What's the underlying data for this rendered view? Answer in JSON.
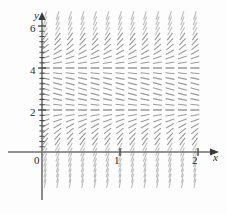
{
  "figure": {
    "background_color": "#fdfdfd",
    "width": 227,
    "height": 214
  },
  "axes": {
    "x_axis_label": "x",
    "y_axis_label": "y",
    "origin_label": "0",
    "axis_color": "#6f6f6f",
    "tick_color": "#4a4a4a",
    "x_ticks": [
      {
        "label": "1",
        "value": 1
      },
      {
        "label": "2",
        "value": 2
      }
    ],
    "y_ticks": [
      {
        "label": "2",
        "value": 2
      },
      {
        "label": "4",
        "value": 4
      },
      {
        "label": "6",
        "value": 6
      }
    ],
    "y_minor_tick_step": 0.25
  },
  "chart_data": {
    "type": "scatter",
    "plot_kind": "slope-field",
    "title": "",
    "xlabel": "x",
    "ylabel": "y",
    "xlim": [
      0,
      2.15
    ],
    "ylim": [
      -1.6,
      6.6
    ],
    "grid": false,
    "legend": null,
    "segment_color": "#8a8a8a",
    "segment_length": 9,
    "equilibrium_lines": [
      2,
      4
    ],
    "slope_rule": "dy/dx = (y-2)*(y-4) : zero at y=2 and y=4, positive for y<2 and y>4, negative for 2<y<4",
    "x": [
      0.04,
      0.2,
      0.36,
      0.52,
      0.68,
      0.84,
      1.0,
      1.16,
      1.32,
      1.48,
      1.64,
      1.8,
      1.96
    ],
    "y": [
      -1.5,
      -1.25,
      -1.0,
      -0.75,
      -0.5,
      -0.25,
      0.0,
      0.25,
      0.5,
      0.75,
      1.0,
      1.25,
      1.5,
      1.75,
      2.0,
      2.25,
      2.5,
      2.75,
      3.0,
      3.25,
      3.5,
      3.75,
      4.0,
      4.25,
      4.5,
      4.75,
      5.0,
      5.25,
      5.5,
      5.75,
      6.0,
      6.25,
      6.5
    ],
    "slopes_by_y": [
      {
        "y": -1.5,
        "slope": 19.25
      },
      {
        "y": -1.25,
        "slope": 17.06
      },
      {
        "y": -1.0,
        "slope": 15.0
      },
      {
        "y": -0.75,
        "slope": 13.06
      },
      {
        "y": -0.5,
        "slope": 11.25
      },
      {
        "y": -0.25,
        "slope": 9.56
      },
      {
        "y": 0.0,
        "slope": 8.0
      },
      {
        "y": 0.25,
        "slope": 6.56
      },
      {
        "y": 0.5,
        "slope": 5.25
      },
      {
        "y": 0.75,
        "slope": 4.06
      },
      {
        "y": 1.0,
        "slope": 3.0
      },
      {
        "y": 1.25,
        "slope": 2.06
      },
      {
        "y": 1.5,
        "slope": 1.25
      },
      {
        "y": 1.75,
        "slope": 0.56
      },
      {
        "y": 2.0,
        "slope": 0.0
      },
      {
        "y": 2.25,
        "slope": -0.44
      },
      {
        "y": 2.5,
        "slope": -0.75
      },
      {
        "y": 2.75,
        "slope": -0.94
      },
      {
        "y": 3.0,
        "slope": -1.0
      },
      {
        "y": 3.25,
        "slope": -0.94
      },
      {
        "y": 3.5,
        "slope": -0.75
      },
      {
        "y": 3.75,
        "slope": -0.44
      },
      {
        "y": 4.0,
        "slope": 0.0
      },
      {
        "y": 4.25,
        "slope": 0.56
      },
      {
        "y": 4.5,
        "slope": 1.25
      },
      {
        "y": 4.75,
        "slope": 2.06
      },
      {
        "y": 5.0,
        "slope": 3.0
      },
      {
        "y": 5.25,
        "slope": 4.06
      },
      {
        "y": 5.5,
        "slope": 5.25
      },
      {
        "y": 5.75,
        "slope": 6.56
      },
      {
        "y": 6.0,
        "slope": 8.0
      },
      {
        "y": 6.25,
        "slope": 9.56
      },
      {
        "y": 6.5,
        "slope": 11.25
      }
    ]
  }
}
